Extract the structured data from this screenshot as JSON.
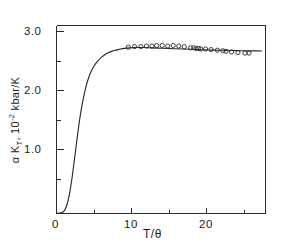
{
  "chart_data": {
    "type": "line",
    "title": "",
    "xlabel": "T/θ",
    "ylabel_parts": {
      "alpha": "α",
      "k": "K",
      "k_sub": "T",
      "comma": ", 10",
      "exp": "-2",
      "units": " kbar/K"
    },
    "ylabel": "α K_T, 10^-2 kbar/K",
    "xlim": [
      0,
      26.5
    ],
    "ylim": [
      0,
      32
    ],
    "x_major_ticks": [
      0,
      10,
      20
    ],
    "x_major_tick_labels": [
      "0",
      "10",
      "20"
    ],
    "x_minor_ticks": [
      5,
      15,
      25
    ],
    "y_major_ticks": [
      10,
      20,
      30
    ],
    "y_major_tick_labels": [
      "1.0",
      "2.0",
      "3.0"
    ],
    "y_minor_ticks": [
      5,
      15,
      25
    ],
    "grid": false,
    "legend": null,
    "series": [
      {
        "name": "theoretical curve",
        "type": "line",
        "style": "solid",
        "color": "#2a2a2a",
        "x": [
          0.0,
          0.6,
          1.0,
          1.3,
          1.6,
          1.9,
          2.2,
          2.5,
          2.8,
          3.1,
          3.4,
          3.7,
          4.0,
          4.4,
          4.8,
          5.2,
          5.6,
          6.0,
          6.5,
          7.0,
          7.5,
          8.0,
          8.6,
          9.2,
          10.0,
          11.0,
          12.0,
          13.0,
          14.0,
          15.0,
          16.0,
          17.0,
          18.0,
          19.0,
          20.0,
          21.0,
          22.0,
          23.0,
          24.0,
          25.0,
          26.0
        ],
        "y": [
          0.0,
          0.1,
          0.5,
          1.4,
          3.0,
          5.4,
          8.4,
          11.6,
          14.7,
          17.4,
          19.6,
          21.4,
          22.8,
          24.2,
          25.2,
          25.9,
          26.5,
          26.9,
          27.3,
          27.6,
          27.8,
          27.95,
          28.1,
          28.2,
          28.25,
          28.25,
          28.2,
          28.15,
          28.1,
          28.05,
          28.0,
          27.95,
          27.9,
          27.85,
          27.8,
          27.78,
          27.75,
          27.72,
          27.7,
          27.68,
          27.66
        ]
      },
      {
        "name": "experimental points",
        "type": "scatter",
        "marker": "open-circle",
        "color": "#2a2a2a",
        "x": [
          9.1,
          9.9,
          10.7,
          11.4,
          12.1,
          12.7,
          13.4,
          14.1,
          14.8,
          15.5,
          16.2,
          17.0,
          17.4,
          17.7,
          18.0,
          18.3,
          18.9,
          19.6,
          20.4,
          21.1,
          21.5,
          22.2,
          23.0,
          23.9,
          24.4
        ],
        "y": [
          28.3,
          28.4,
          28.4,
          28.5,
          28.5,
          28.6,
          28.6,
          28.5,
          28.6,
          28.5,
          28.4,
          28.2,
          28.2,
          28.1,
          28.1,
          28.0,
          28.0,
          27.9,
          27.8,
          27.7,
          27.6,
          27.5,
          27.4,
          27.3,
          27.3
        ]
      }
    ]
  },
  "axes": {
    "x_labels": [
      "0",
      "10",
      "20"
    ],
    "y_labels": [
      "1.0",
      "2.0",
      "3.0"
    ]
  }
}
